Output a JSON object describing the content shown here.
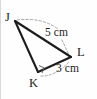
{
  "figure": {
    "kind": "geometry-diagram",
    "shape_name": "triangle",
    "canvas": {
      "width": 97,
      "height": 99
    },
    "stroke_color": "#1d1d1d",
    "dash_color": "#9a9a9a",
    "background_color": "#fefefe",
    "vertices": [
      {
        "id": "J",
        "label": "J",
        "x": 15,
        "y": 21
      },
      {
        "id": "K",
        "label": "K",
        "x": 38,
        "y": 72
      },
      {
        "id": "L",
        "label": "L",
        "x": 71,
        "y": 57
      }
    ],
    "edges": [
      {
        "id": "JL",
        "from": "J",
        "to": "L",
        "style": "solid"
      },
      {
        "id": "JK",
        "from": "J",
        "to": "K",
        "style": "solid"
      },
      {
        "id": "KL",
        "from": "K",
        "to": "L",
        "style": "solid"
      }
    ],
    "measures": [
      {
        "id": "len-jl",
        "edge": "JL",
        "value": "5",
        "unit": "cm",
        "text": "5 cm"
      },
      {
        "id": "len-kl",
        "edge": "KL",
        "value": "3",
        "unit": "cm",
        "text": "3 cm"
      }
    ],
    "right_angle_marks": [
      {
        "at": "K",
        "text": "right-angle-mark"
      }
    ],
    "leaders": [
      {
        "id": "leader-jl",
        "style": "dashed",
        "from_label": "len-jl",
        "to_edge": "JL"
      },
      {
        "id": "leader-kl",
        "style": "dashed",
        "from_label": "len-kl",
        "to_edge": "KL"
      }
    ]
  }
}
